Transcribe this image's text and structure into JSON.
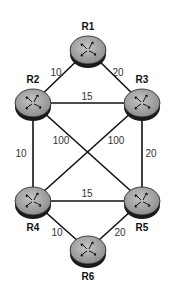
{
  "diagram": {
    "type": "network-topology",
    "nodes": [
      {
        "id": "R1",
        "label": "R1",
        "icon": "router-icon"
      },
      {
        "id": "R2",
        "label": "R2",
        "icon": "router-icon"
      },
      {
        "id": "R3",
        "label": "R3",
        "icon": "router-icon"
      },
      {
        "id": "R4",
        "label": "R4",
        "icon": "router-icon"
      },
      {
        "id": "R5",
        "label": "R5",
        "icon": "router-icon"
      },
      {
        "id": "R6",
        "label": "R6",
        "icon": "router-icon"
      }
    ],
    "edges": [
      {
        "from": "R1",
        "to": "R2",
        "cost": "10"
      },
      {
        "from": "R1",
        "to": "R3",
        "cost": "20"
      },
      {
        "from": "R2",
        "to": "R3",
        "cost": "15"
      },
      {
        "from": "R2",
        "to": "R4",
        "cost": "10"
      },
      {
        "from": "R3",
        "to": "R5",
        "cost": "20"
      },
      {
        "from": "R2",
        "to": "R5",
        "cost": "100"
      },
      {
        "from": "R3",
        "to": "R4",
        "cost": "100"
      },
      {
        "from": "R4",
        "to": "R5",
        "cost": "15"
      },
      {
        "from": "R4",
        "to": "R6",
        "cost": "10"
      },
      {
        "from": "R5",
        "to": "R6",
        "cost": "20"
      }
    ],
    "colors": {
      "router_body": "#a8a8a8",
      "router_base": "#1a1a1a",
      "edge": "#111111"
    }
  }
}
